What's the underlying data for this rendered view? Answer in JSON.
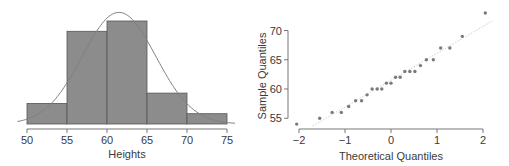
{
  "chart_data": [
    {
      "type": "bar",
      "subtype": "histogram",
      "title": "",
      "xlabel": "Heights",
      "ylabel": "",
      "bins": [
        [
          50,
          55
        ],
        [
          55,
          60
        ],
        [
          60,
          65
        ],
        [
          65,
          70
        ],
        [
          70,
          75
        ]
      ],
      "categories": [
        "50-55",
        "55-60",
        "60-65",
        "65-70",
        "70-75"
      ],
      "values": [
        2,
        9,
        10,
        3,
        1
      ],
      "xticks": [
        50,
        55,
        60,
        65,
        70,
        75
      ],
      "xlim": [
        49,
        76
      ],
      "overlay": {
        "type": "normal_curve",
        "mean": 61.5,
        "sd": 4.6
      },
      "grid": false,
      "colors": {
        "bar_fill": "#8c8c8c",
        "bar_edge": "#555555",
        "curve": "#808080"
      }
    },
    {
      "type": "scatter",
      "subtype": "qq-plot",
      "title": "",
      "xlabel": "Theoretical Quantiles",
      "ylabel": "Sample Quantiles",
      "x": [
        -2.05,
        -1.55,
        -1.28,
        -1.08,
        -0.92,
        -0.77,
        -0.64,
        -0.52,
        -0.41,
        -0.3,
        -0.2,
        -0.1,
        0.0,
        0.1,
        0.2,
        0.3,
        0.41,
        0.52,
        0.64,
        0.77,
        0.92,
        1.08,
        1.28,
        1.55,
        2.05
      ],
      "y": [
        54,
        55,
        56,
        56,
        57,
        58,
        58,
        59,
        60,
        60,
        60,
        61,
        61,
        62,
        62,
        63,
        63,
        63,
        64,
        65,
        65,
        67,
        67,
        69,
        73
      ],
      "xticks": [
        -2,
        -1,
        0,
        1,
        2
      ],
      "yticks": [
        55,
        60,
        65,
        70
      ],
      "xlim": [
        -2.2,
        2.2
      ],
      "ylim": [
        53,
        74
      ],
      "reference_line": {
        "slope": 4.6,
        "intercept": 61.5,
        "style": "dotted"
      },
      "grid": false,
      "colors": {
        "points": "#7a7a7a",
        "line": "#d0d0d0"
      }
    }
  ],
  "labels": {
    "hist_xlabel": "Heights",
    "qq_xlabel": "Theoretical Quantiles",
    "qq_ylabel": "Sample Quantiles"
  }
}
